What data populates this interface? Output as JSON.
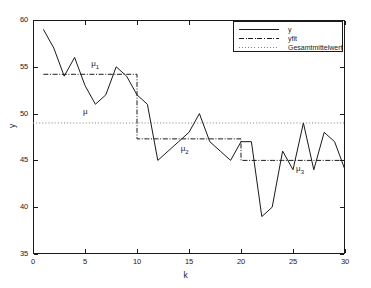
{
  "chart_data": {
    "type": "line",
    "title": "",
    "xlabel": "k",
    "ylabel": "y",
    "xlim": [
      0,
      30
    ],
    "ylim": [
      35,
      60
    ],
    "xticks": [
      0,
      5,
      10,
      15,
      20,
      25,
      30
    ],
    "yticks": [
      35,
      40,
      45,
      50,
      55,
      60
    ],
    "grid": false,
    "legend_position": "top-right",
    "x": [
      1,
      2,
      3,
      4,
      5,
      6,
      7,
      8,
      9,
      10,
      11,
      12,
      13,
      14,
      15,
      16,
      17,
      18,
      19,
      20,
      21,
      22,
      23,
      24,
      25,
      26,
      27,
      28,
      29,
      30
    ],
    "series": [
      {
        "name": "y",
        "style": "solid",
        "color": "#1a1a1a",
        "values": [
          59,
          57,
          54,
          56,
          53,
          51,
          52,
          55,
          54,
          52,
          51,
          45,
          46,
          47,
          48,
          50,
          47,
          46,
          45,
          47,
          47,
          39,
          40,
          46,
          44,
          49,
          44,
          48,
          47,
          44
        ]
      },
      {
        "name": "yfit",
        "style": "dash-dot",
        "color": "#1a1a1a",
        "values": [
          54.2,
          54.2,
          54.2,
          54.2,
          54.2,
          54.2,
          54.2,
          54.2,
          54.2,
          54.2,
          47.3,
          47.3,
          47.3,
          47.3,
          47.3,
          47.3,
          47.3,
          47.3,
          47.3,
          47.3,
          45.0,
          45.0,
          45.0,
          45.0,
          45.0,
          45.0,
          45.0,
          45.0,
          45.0,
          45.0
        ]
      },
      {
        "name": "Gesamtmittelwert",
        "style": "dotted",
        "color": "#808080",
        "constant": 49.0
      }
    ],
    "segment_means": [
      {
        "label": "mu_1",
        "value": 54.2,
        "x_start": 1,
        "x_end": 10
      },
      {
        "label": "mu_2",
        "value": 47.3,
        "x_start": 11,
        "x_end": 20
      },
      {
        "label": "mu_3",
        "value": 45.0,
        "x_start": 21,
        "x_end": 30
      }
    ],
    "overall_mean": 49.0,
    "annotations": [
      {
        "name": "mu-1-label",
        "text": "μ",
        "sub": "1",
        "x": 5.6,
        "y": 55.2
      },
      {
        "name": "mu-label",
        "text": "μ",
        "sub": "",
        "x": 4.8,
        "y": 50.1
      },
      {
        "name": "mu-2-label",
        "text": "μ",
        "sub": "2",
        "x": 14.2,
        "y": 46.1
      },
      {
        "name": "mu-3-label",
        "text": "μ",
        "sub": "3",
        "x": 25.3,
        "y": 44.0
      }
    ]
  },
  "legend": {
    "items": [
      {
        "label": "y"
      },
      {
        "label": "yfit"
      },
      {
        "label": "Gesamtmittelwert"
      }
    ]
  },
  "axes": {
    "xlabel": "k",
    "ylabel": "y",
    "xtick_labels": [
      "0",
      "5",
      "10",
      "15",
      "20",
      "25",
      "30"
    ],
    "ytick_labels": [
      "35",
      "40",
      "45",
      "50",
      "55",
      "60"
    ]
  }
}
